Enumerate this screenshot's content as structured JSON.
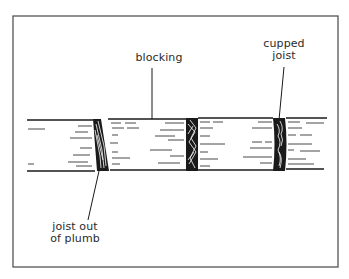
{
  "figure": {
    "type": "framing-diagram",
    "colors": {
      "ink": "#1a1a1a",
      "paper": "#ffffff",
      "frame": "#555555"
    },
    "labels": {
      "blocking": "blocking",
      "cupped_joist_line1": "cupped",
      "cupped_joist_line2": "joist",
      "out_of_plumb_line1": "joist out",
      "out_of_plumb_line2": "of plumb"
    },
    "components": [
      {
        "name": "joist-left-out-of-plumb",
        "condition": "out of plumb (tilted)"
      },
      {
        "name": "joist-middle",
        "condition": "straight"
      },
      {
        "name": "joist-right-cupped",
        "condition": "cupped"
      },
      {
        "name": "blocking-segments",
        "count": 4
      }
    ]
  }
}
